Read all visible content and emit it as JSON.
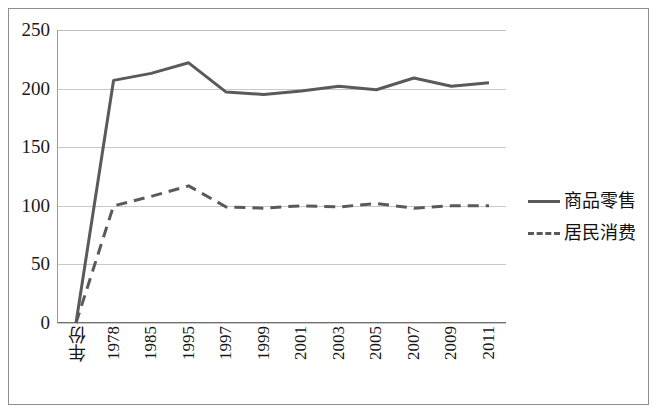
{
  "chart_data": {
    "type": "line",
    "title": "",
    "xlabel": "",
    "ylabel": "",
    "ylim": [
      0,
      250
    ],
    "yticks": [
      0,
      50,
      100,
      150,
      200,
      250
    ],
    "grid": true,
    "legend_position": "right",
    "categories": [
      "年份",
      "1978",
      "1985",
      "1995",
      "1997",
      "1999",
      "2001",
      "2003",
      "2005",
      "2007",
      "2009",
      "2011"
    ],
    "series": [
      {
        "name": "商品零售",
        "style": "solid",
        "color": "#5a5a5a",
        "values": [
          0,
          207,
          213,
          222,
          197,
          195,
          198,
          202,
          199,
          209,
          202,
          205
        ]
      },
      {
        "name": "居民消费",
        "style": "dashed",
        "color": "#5a5a5a",
        "values": [
          0,
          100,
          108,
          117,
          99,
          98,
          100,
          99,
          102,
          98,
          100,
          100
        ]
      }
    ]
  },
  "axis": {
    "y_tick_labels": [
      "250",
      "200",
      "150",
      "100",
      "50",
      "0"
    ]
  },
  "legend": {
    "items": [
      {
        "label": "商品零售",
        "style": "solid"
      },
      {
        "label": "居民消费",
        "style": "dashed"
      }
    ]
  }
}
